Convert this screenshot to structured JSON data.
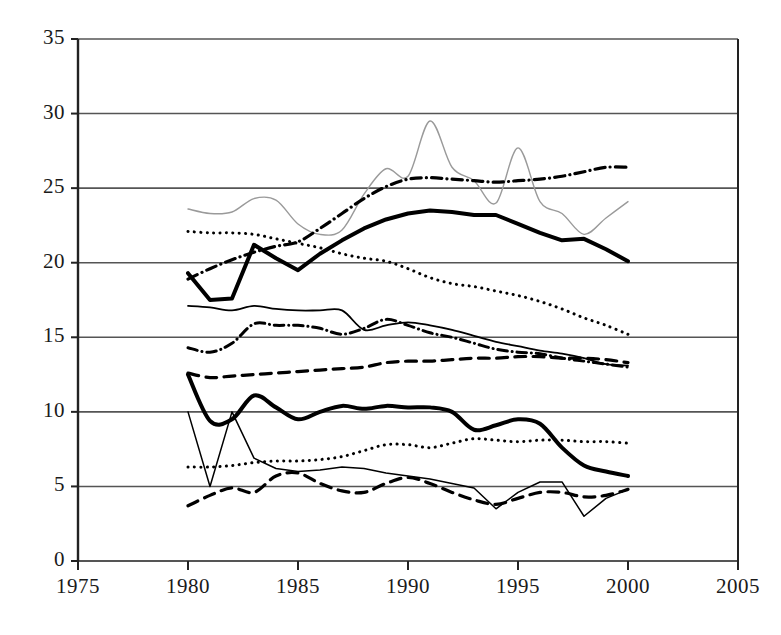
{
  "chart_data": {
    "type": "line",
    "title": "",
    "subtitle": "",
    "xlabel": "",
    "ylabel": "",
    "xlim": [
      1975,
      2005
    ],
    "ylim": [
      0,
      35
    ],
    "x_ticks": [
      1975,
      1980,
      1985,
      1990,
      1995,
      2000,
      2005
    ],
    "y_ticks": [
      0,
      5,
      10,
      15,
      20,
      25,
      30,
      35
    ],
    "grid": "horizontal",
    "legend": "none",
    "annotations": [],
    "colors": {
      "ink": "#000000",
      "gray_line": "#9a9a9a",
      "grid": "#555555",
      "axis": "#222222",
      "background": "#ffffff"
    },
    "x": [
      1980,
      1981,
      1982,
      1983,
      1984,
      1985,
      1986,
      1987,
      1988,
      1989,
      1990,
      1991,
      1992,
      1993,
      1994,
      1995,
      1996,
      1997,
      1998,
      1999,
      2000
    ],
    "series": [
      {
        "name": "series-1-thin-gray-solid",
        "style": "solid",
        "width": 1.4,
        "color": "#9a9a9a",
        "values": [
          23.6,
          23.3,
          23.4,
          24.3,
          24.2,
          22.6,
          21.9,
          22.2,
          24.6,
          26.3,
          25.8,
          29.5,
          26.4,
          25.5,
          24.0,
          27.7,
          24.1,
          23.3,
          21.9,
          23.0,
          24.1
        ]
      },
      {
        "name": "series-2-dash-dot-upper",
        "style": "dash-dot",
        "width": 3.2,
        "color": "#000000",
        "values": [
          18.9,
          19.6,
          20.2,
          20.7,
          21.1,
          21.4,
          22.3,
          23.3,
          24.3,
          25.1,
          25.6,
          25.7,
          25.6,
          25.5,
          25.4,
          25.5,
          25.6,
          25.8,
          26.1,
          26.4,
          26.4
        ]
      },
      {
        "name": "series-3-thick-black-solid-upper",
        "style": "solid",
        "width": 4.0,
        "color": "#000000",
        "values": [
          19.3,
          17.5,
          17.6,
          21.2,
          20.3,
          19.5,
          20.6,
          21.5,
          22.3,
          22.9,
          23.3,
          23.5,
          23.4,
          23.2,
          23.2,
          22.6,
          22.0,
          21.5,
          21.6,
          20.9,
          20.1
        ]
      },
      {
        "name": "series-4-dotted-upper",
        "style": "dotted",
        "width": 3.0,
        "color": "#000000",
        "values": [
          22.1,
          22.0,
          22.0,
          21.9,
          21.6,
          21.3,
          21.0,
          20.6,
          20.3,
          20.1,
          19.6,
          19.0,
          18.6,
          18.4,
          18.1,
          17.8,
          17.4,
          16.9,
          16.3,
          15.8,
          15.2
        ]
      },
      {
        "name": "series-5-thin-black-solid-mid",
        "style": "solid",
        "width": 1.8,
        "color": "#000000",
        "values": [
          17.1,
          17.0,
          16.8,
          17.1,
          16.9,
          16.8,
          16.8,
          16.8,
          15.5,
          15.8,
          16.0,
          15.8,
          15.5,
          15.1,
          14.7,
          14.4,
          14.1,
          13.9,
          13.6,
          13.2,
          13.1
        ]
      },
      {
        "name": "series-6-dash-dot-mid",
        "style": "dash-dot",
        "width": 3.0,
        "color": "#000000",
        "values": [
          14.3,
          14.0,
          14.6,
          15.9,
          15.8,
          15.8,
          15.6,
          15.2,
          15.6,
          16.2,
          15.8,
          15.3,
          15.0,
          14.6,
          14.2,
          14.0,
          13.9,
          13.6,
          13.4,
          13.2,
          13.0
        ]
      },
      {
        "name": "series-7-dashed-mid",
        "style": "dashed",
        "width": 3.2,
        "color": "#000000",
        "values": [
          12.6,
          12.3,
          12.4,
          12.5,
          12.6,
          12.7,
          12.8,
          12.9,
          13.0,
          13.3,
          13.4,
          13.4,
          13.5,
          13.6,
          13.6,
          13.7,
          13.7,
          13.6,
          13.6,
          13.5,
          13.3
        ]
      },
      {
        "name": "series-8-thick-black-solid-lower",
        "style": "solid",
        "width": 4.0,
        "color": "#000000",
        "values": [
          12.5,
          9.4,
          9.5,
          11.1,
          10.3,
          9.5,
          10.0,
          10.4,
          10.2,
          10.4,
          10.3,
          10.3,
          10.0,
          8.8,
          9.1,
          9.5,
          9.2,
          7.6,
          6.4,
          6.0,
          5.7
        ]
      },
      {
        "name": "series-9-thin-black-solid-lower",
        "style": "solid",
        "width": 1.5,
        "color": "#000000",
        "values": [
          10.0,
          5.0,
          10.0,
          6.9,
          6.2,
          6.0,
          6.1,
          6.3,
          6.2,
          5.9,
          5.7,
          5.5,
          5.2,
          4.9,
          3.5,
          4.6,
          5.3,
          5.3,
          3.0,
          4.2,
          4.8
        ]
      },
      {
        "name": "series-10-dotted-lower",
        "style": "dotted",
        "width": 3.0,
        "color": "#000000",
        "values": [
          6.3,
          6.3,
          6.4,
          6.6,
          6.7,
          6.7,
          6.8,
          7.0,
          7.4,
          7.8,
          7.8,
          7.6,
          7.9,
          8.2,
          8.1,
          8.0,
          8.1,
          8.1,
          8.0,
          8.0,
          7.9
        ]
      },
      {
        "name": "series-11-dashed-lower",
        "style": "dashed",
        "width": 3.2,
        "color": "#000000",
        "values": [
          3.7,
          4.4,
          4.9,
          4.6,
          5.7,
          5.9,
          5.2,
          4.7,
          4.6,
          5.2,
          5.6,
          5.2,
          4.6,
          4.1,
          3.8,
          4.2,
          4.6,
          4.6,
          4.3,
          4.4,
          4.8
        ]
      }
    ]
  },
  "axis": {
    "y_labels": [
      "35",
      "30",
      "25",
      "20",
      "15",
      "10",
      "5",
      "0"
    ],
    "x_labels": [
      "1975",
      "1980",
      "1985",
      "1990",
      "1995",
      "2000",
      "2005"
    ]
  }
}
